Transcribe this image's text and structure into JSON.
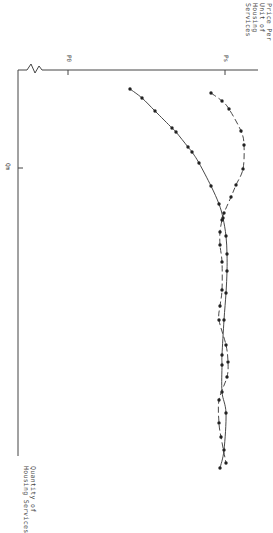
{
  "chart_data": {
    "type": "line",
    "orientation": "rotated-90-clockwise",
    "title": "",
    "xlabel": "Quantity of Housing Services",
    "ylabel": "Price Per Unit of Housing Services",
    "ylabel_lines": [
      "Price Per",
      "Unit of",
      "Housing",
      "Services"
    ],
    "xlabel_lines": [
      "Quantity of",
      "Housing Services"
    ],
    "x_ticks": [
      {
        "label": "Qm",
        "screen_y": 168
      }
    ],
    "y_ticks": [
      {
        "label": "P0",
        "screen_x": 68
      },
      {
        "label": "Ps",
        "screen_x": 225
      }
    ],
    "axis_break": true,
    "grid": false,
    "legend": null,
    "series": [
      {
        "name": "solid-curve",
        "style": "solid",
        "points_screen": [
          [
            130,
            89
          ],
          [
            142,
            98
          ],
          [
            155,
            111
          ],
          [
            172,
            128
          ],
          [
            176,
            132
          ],
          [
            188,
            147
          ],
          [
            192,
            152
          ],
          [
            199,
            163
          ],
          [
            211,
            186
          ],
          [
            219,
            204
          ],
          [
            223,
            218
          ],
          [
            226,
            236
          ],
          [
            227,
            254
          ],
          [
            227,
            271
          ],
          [
            226,
            293
          ],
          [
            224,
            320
          ],
          [
            222,
            355
          ],
          [
            222,
            365
          ],
          [
            222,
            392
          ],
          [
            226,
            413
          ],
          [
            224,
            450
          ],
          [
            220,
            468
          ]
        ]
      },
      {
        "name": "dashed-curve",
        "style": "dashed",
        "points_screen": [
          [
            211,
            93
          ],
          [
            222,
            101
          ],
          [
            229,
            109
          ],
          [
            241,
            131
          ],
          [
            244,
            145
          ],
          [
            243,
            169
          ],
          [
            236,
            185
          ],
          [
            231,
            197
          ],
          [
            224,
            213
          ],
          [
            222,
            220
          ],
          [
            220,
            232
          ],
          [
            220,
            245
          ],
          [
            222,
            262
          ],
          [
            222,
            290
          ],
          [
            220,
            306
          ],
          [
            219,
            320
          ],
          [
            226,
            345
          ],
          [
            228,
            362
          ],
          [
            227,
            377
          ],
          [
            219,
            400
          ],
          [
            219,
            423
          ],
          [
            221,
            437
          ],
          [
            226,
            463
          ]
        ]
      }
    ]
  },
  "labels": {
    "y_axis": "Price Per\nUnit of\nHousing\nServices",
    "x_axis": "Quantity of\nHousing Services",
    "p0": "P0",
    "ps": "Ps",
    "qm": "Qm"
  },
  "colors": {
    "line": "#333333",
    "marker": "#222222",
    "axis": "#444444"
  }
}
